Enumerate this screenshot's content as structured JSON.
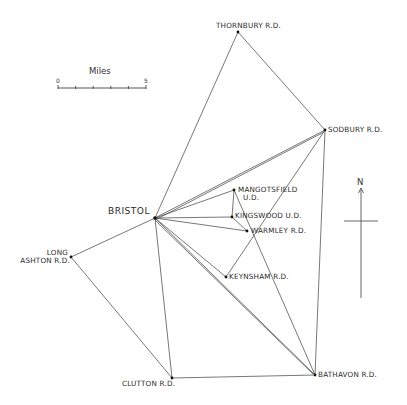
{
  "diagram": {
    "type": "network-map",
    "line_color": "#555555",
    "node_color": "#111111",
    "nodes": [
      {
        "id": "thornbury",
        "label": "THORNBURY R.D.",
        "x": 238,
        "y": 32
      },
      {
        "id": "sodbury",
        "label": "SODBURY R.D.",
        "x": 325,
        "y": 130
      },
      {
        "id": "bristol",
        "label": "BRISTOL",
        "x": 155,
        "y": 218
      },
      {
        "id": "mangotsfield",
        "label": "MANGOTSFIELD",
        "label2": "U.D.",
        "x": 234,
        "y": 190
      },
      {
        "id": "kingswood",
        "label": "KINGSWOOD U.D.",
        "x": 232,
        "y": 217
      },
      {
        "id": "warmley",
        "label": "WARMLEY R.D.",
        "x": 247,
        "y": 231
      },
      {
        "id": "keynsham",
        "label": "KEYNSHAM R.D.",
        "x": 226,
        "y": 277
      },
      {
        "id": "long_ashton",
        "label": "LONG",
        "label2": "ASHTON R.D.",
        "x": 71,
        "y": 257
      },
      {
        "id": "clutton",
        "label": "CLUTTON R.D.",
        "x": 172,
        "y": 378
      },
      {
        "id": "bathavon",
        "label": "BATHAVON R.D.",
        "x": 315,
        "y": 375
      }
    ],
    "edges": [
      [
        "bristol",
        "thornbury"
      ],
      [
        "thornbury",
        "sodbury"
      ],
      [
        "bristol",
        "sodbury"
      ],
      [
        "bristol",
        "sodbury_b"
      ],
      [
        "bristol",
        "mangotsfield"
      ],
      [
        "bristol",
        "kingswood"
      ],
      [
        "bristol",
        "warmley"
      ],
      [
        "bristol",
        "keynsham"
      ],
      [
        "bristol",
        "bathavon"
      ],
      [
        "bristol",
        "bathavon_b"
      ],
      [
        "bristol",
        "clutton"
      ],
      [
        "bristol",
        "long_ashton"
      ],
      [
        "long_ashton",
        "clutton"
      ],
      [
        "clutton",
        "bathavon"
      ],
      [
        "sodbury",
        "bathavon"
      ],
      [
        "sodbury",
        "keynsham"
      ],
      [
        "mangotsfield",
        "kingswood"
      ],
      [
        "mangotsfield",
        "bathavon"
      ],
      [
        "kingswood",
        "warmley"
      ]
    ]
  },
  "scale_bar": {
    "title": "Miles",
    "start_label": "0",
    "end_label": "5",
    "divisions": 5
  },
  "north_arrow": {
    "label": "N"
  }
}
